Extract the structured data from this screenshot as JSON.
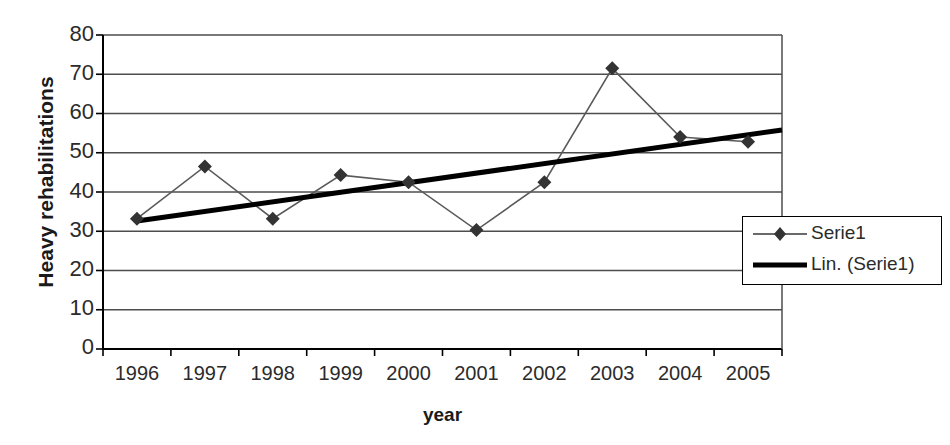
{
  "chart_data": {
    "type": "line",
    "title": "",
    "xlabel": "year",
    "ylabel": "Heavy rehabilitations",
    "categories": [
      "1996",
      "1997",
      "1998",
      "1999",
      "2000",
      "2001",
      "2002",
      "2003",
      "2004",
      "2005"
    ],
    "series": [
      {
        "name": "Serie1",
        "type": "line-marker",
        "marker": "diamond",
        "values": [
          33.2,
          46.5,
          33.2,
          44.3,
          42.5,
          30.3,
          42.5,
          71.5,
          54.0,
          52.8
        ]
      },
      {
        "name": "Lin. (Serie1)",
        "type": "linear-trendline",
        "endpoints": [
          32.6,
          55.8
        ]
      }
    ],
    "ylim": [
      0,
      80
    ],
    "ytick_step": 10,
    "ytick_labels": [
      "80",
      "70",
      "60",
      "50",
      "40",
      "30",
      "20",
      "10",
      "0"
    ],
    "grid": "horizontal",
    "legend_position": "bottom-right-inside",
    "colors": {
      "series_line": "#555555",
      "trendline": "#000000",
      "marker": "#333333",
      "gridline": "#4d4d4d",
      "axis": "#000000",
      "text": "#2b2b2b",
      "background": "#ffffff"
    }
  },
  "legend": {
    "items": [
      {
        "label": "Serie1",
        "swatch": "line-with-diamond-marker"
      },
      {
        "label": "Lin. (Serie1)",
        "swatch": "thick-line"
      }
    ]
  },
  "cut_off_header": ""
}
